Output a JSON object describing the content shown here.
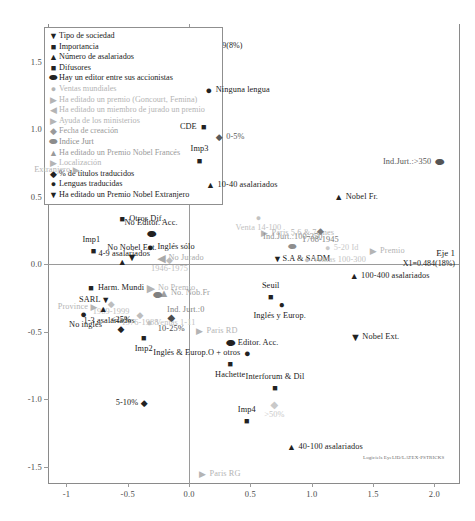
{
  "axes": {
    "x_axis_name": "Eje 1",
    "x_axis_value": "X1=0.484(18%)",
    "y_axis_name": "Eje 2",
    "y_axis_value": "X2=0.219(8%)",
    "x_ticks": [
      "-1",
      "-0.5",
      "0.0",
      "0.5",
      "1.0",
      "1.5",
      "2.0"
    ],
    "y_ticks": [
      "1.5",
      "1.0",
      "0.5",
      "0.0",
      "-0.5",
      "-1.0",
      "-1.5"
    ],
    "xlim": [
      -1.15,
      2.2
    ],
    "ylim": [
      -1.62,
      1.78
    ]
  },
  "software_credit": "Logiciels EyeLID/LATEX-PSTRICKS",
  "legend": {
    "items": [
      {
        "marker": "triangle-down-dark",
        "glyph": "▼",
        "color": "#222222",
        "label": "Tipo de sociedad"
      },
      {
        "marker": "square-dark",
        "glyph": "■",
        "color": "#222222",
        "label": "Importancia"
      },
      {
        "marker": "triangle-up-dark",
        "glyph": "▲",
        "color": "#222222",
        "label": "Número de asalariados"
      },
      {
        "marker": "square-dark",
        "glyph": "■",
        "color": "#222222",
        "label": "Difusores"
      },
      {
        "marker": "ellipse-dark",
        "glyph": "⬬",
        "color": "#222222",
        "label": "Hay un editor entre sus accionistas"
      },
      {
        "marker": "circle-gray",
        "glyph": "●",
        "color": "#b4b4b4",
        "label": "Ventas mundiales"
      },
      {
        "marker": "triangle-right-gray",
        "glyph": "▶",
        "color": "#b4b4b4",
        "label": "Ha editado un premio (Goncourt, Femina)"
      },
      {
        "marker": "triangle-left-gray",
        "glyph": "◀",
        "color": "#b4b4b4",
        "label": "Ha editado un miembro de jurado un premio"
      },
      {
        "marker": "triangle-right-gray",
        "glyph": "▶",
        "color": "#b4b4b4",
        "label": "Ayuda de los ministerios"
      },
      {
        "marker": "diamond-gray",
        "glyph": "◆",
        "color": "#9a9a9a",
        "label": "Fecha de creación"
      },
      {
        "marker": "ellipse-gray",
        "glyph": "⬬",
        "color": "#8c8c8c",
        "label": "Indice Jurt"
      },
      {
        "marker": "triangle-up-gray",
        "glyph": "▲",
        "color": "#9a9a9a",
        "label": "Ha editado un Premio Nobel Francés"
      },
      {
        "marker": "triangle-right-gray",
        "glyph": "▶",
        "color": "#b4b4b4",
        "label": "Localización"
      },
      {
        "marker": "diamond-dark",
        "glyph": "◆",
        "color": "#222222",
        "label": "% de títulos traducidos"
      },
      {
        "marker": "circle-dark",
        "glyph": "●",
        "color": "#222222",
        "label": "Lenguas traducidas"
      },
      {
        "marker": "triangle-down-dark2",
        "glyph": "▼",
        "color": "#222222",
        "label": "Ha editado un Premio Nobel Extranjero"
      }
    ]
  },
  "chart_data": {
    "type": "scatter",
    "title": "",
    "xlabel": "Eje 1  X1=0.484(18%)",
    "ylabel": "Eje 2  X2=0.219(8%)",
    "xlim": [
      -1.15,
      2.2
    ],
    "ylim": [
      -1.62,
      1.78
    ],
    "grid": false,
    "legend_position": "top-left",
    "points": [
      {
        "label": "Ninguna lengua",
        "x": 0.16,
        "y": 1.29,
        "glyph": "●",
        "color": "#222222",
        "size": 11,
        "lpos": "l",
        "ldx": 7,
        "ldy": 0
      },
      {
        "label": "CDE",
        "x": 0.12,
        "y": 1.02,
        "glyph": "■",
        "color": "#222222",
        "size": 9,
        "lpos": "r",
        "ldx": -7,
        "ldy": 0
      },
      {
        "label": "0-5%",
        "x": 0.245,
        "y": 0.945,
        "glyph": "◆",
        "color": "#5a5a5a",
        "size": 9,
        "lpos": "l",
        "ldx": 7,
        "ldy": 0
      },
      {
        "label": "Imp3",
        "x": 0.085,
        "y": 0.765,
        "glyph": "■",
        "color": "#222222",
        "size": 9,
        "lpos": "c",
        "ldx": 0,
        "ldy": -12
      },
      {
        "label": "Extranjero",
        "x": -0.92,
        "y": 0.7,
        "glyph": "▶",
        "color": "#b4b4b4",
        "size": 9,
        "lpos": "r",
        "ldx": -6,
        "ldy": 0
      },
      {
        "label": "Ind.Jurt.:>350",
        "x": 2.04,
        "y": 0.755,
        "glyph": "⬬",
        "color": "#555555",
        "size": 11,
        "lpos": "r",
        "ldx": -8,
        "ldy": 0
      },
      {
        "label": "Imp1",
        "x": -0.78,
        "y": 0.095,
        "glyph": "■",
        "color": "#222222",
        "size": 9,
        "lpos": "c",
        "ldx": -2,
        "ldy": -11
      },
      {
        "label": "10-40 asalariados",
        "x": 0.175,
        "y": 0.59,
        "glyph": "▲",
        "color": "#222222",
        "size": 9,
        "lpos": "l",
        "ldx": 7,
        "ldy": 0
      },
      {
        "label": "Nobel Fr.",
        "x": 1.22,
        "y": 0.5,
        "glyph": "▲",
        "color": "#222222",
        "size": 9,
        "lpos": "l",
        "ldx": 7,
        "ldy": 0
      },
      {
        "label": "Otros Dif.",
        "x": -0.545,
        "y": 0.335,
        "glyph": "■",
        "color": "#222222",
        "size": 9,
        "lpos": "l",
        "ldx": 7,
        "ldy": 0
      },
      {
        "label": "Venta 14-100",
        "x": 0.565,
        "y": 0.34,
        "glyph": "●",
        "color": "#c2c2c2",
        "size": 9,
        "lpos": "c",
        "ldx": 0,
        "ldy": 10
      },
      {
        "label": "Paris 5,6 & 7emes",
        "x": 0.615,
        "y": 0.235,
        "glyph": "▶",
        "color": "#b4b4b4",
        "size": 9,
        "lpos": "l",
        "ldx": 7,
        "ldy": 0
      },
      {
        "label": "1708-1945",
        "x": 1.07,
        "y": 0.245,
        "glyph": "◆",
        "color": "#7a7a7a",
        "size": 9,
        "lpos": "c",
        "ldx": 0,
        "ldy": 9
      },
      {
        "label": "No Editor. Acc.",
        "x": -0.31,
        "y": 0.225,
        "glyph": "⬬",
        "color": "#222222",
        "size": 11,
        "lpos": "c",
        "ldx": 0,
        "ldy": -11
      },
      {
        "label": "Inglés sólo",
        "x": -0.315,
        "y": 0.125,
        "glyph": "●",
        "color": "#222222",
        "size": 11,
        "lpos": "l",
        "ldx": 7,
        "ldy": 0
      },
      {
        "label": "No Nobel Ext.",
        "x": -0.465,
        "y": 0.055,
        "glyph": "▼",
        "color": "#222222",
        "size": 11,
        "lpos": "c",
        "ldx": 0,
        "ldy": -9
      },
      {
        "label": "4-9 asalariados",
        "x": -0.545,
        "y": 0.015,
        "glyph": "▲",
        "color": "#222222",
        "size": 9,
        "lpos": "c",
        "ldx": 2,
        "ldy": -8
      },
      {
        "label": "No Jurado",
        "x": -0.225,
        "y": 0.045,
        "glyph": "◀",
        "color": "#a9a9a9",
        "size": 11,
        "lpos": "l",
        "ldx": 7,
        "ldy": 0
      },
      {
        "label": "1946-1975",
        "x": -0.16,
        "y": 0.03,
        "glyph": "◆",
        "color": "#bdbdbd",
        "size": 9,
        "lpos": "c",
        "ldx": 0,
        "ldy": 9
      },
      {
        "label": "S.A & SADM",
        "x": 0.72,
        "y": 0.04,
        "glyph": "▼",
        "color": "#222222",
        "size": 9,
        "lpos": "l",
        "ldx": 5,
        "ldy": 0
      },
      {
        "label": "Ventas 100-300",
        "x": 0.96,
        "y": 0.035,
        "glyph": "●",
        "color": "#c2c2c2",
        "size": 9,
        "lpos": "l",
        "ldx": 6,
        "ldy": 0
      },
      {
        "label": "Premio",
        "x": 1.5,
        "y": 0.1,
        "glyph": "▶",
        "color": "#b4b4b4",
        "size": 9,
        "lpos": "l",
        "ldx": 7,
        "ldy": 0
      },
      {
        "label": "Ind.Jurt.:100-350",
        "x": 0.845,
        "y": 0.125,
        "glyph": "⬬",
        "color": "#8e8e8e",
        "size": 10,
        "lpos": "c",
        "ldx": 0,
        "ldy": -10
      },
      {
        "label": "5-20 Id",
        "x": 1.13,
        "y": 0.12,
        "glyph": "●",
        "color": "#c9c9c9",
        "size": 9,
        "lpos": "l",
        "ldx": 6,
        "ldy": 0
      },
      {
        "label": "100-400 asalariados",
        "x": 1.345,
        "y": -0.09,
        "glyph": "▲",
        "color": "#222222",
        "size": 9,
        "lpos": "l",
        "ldx": 7,
        "ldy": 0
      },
      {
        "label": "Harm. Mundi",
        "x": -0.8,
        "y": -0.175,
        "glyph": "■",
        "color": "#222222",
        "size": 9,
        "lpos": "l",
        "ldx": 7,
        "ldy": 0
      },
      {
        "label": "No Premio",
        "x": -0.31,
        "y": -0.175,
        "glyph": "▶",
        "color": "#b4b4b4",
        "size": 11,
        "lpos": "l",
        "ldx": 7,
        "ldy": 0
      },
      {
        "label": "No. Nob.Fr",
        "x": -0.205,
        "y": -0.215,
        "glyph": "▲",
        "color": "#9e9e9e",
        "size": 11,
        "lpos": "l",
        "ldx": 7,
        "ldy": 0
      },
      {
        "label": "Ind. Jurt.:0",
        "x": -0.255,
        "y": -0.225,
        "glyph": "⬬",
        "color": "#808080",
        "size": 11,
        "lpos": "c",
        "ldx": 28,
        "ldy": 15
      },
      {
        "label": "Seuil",
        "x": 0.665,
        "y": -0.24,
        "glyph": "■",
        "color": "#222222",
        "size": 9,
        "lpos": "c",
        "ldx": 0,
        "ldy": -11
      },
      {
        "label": "Inglés y Europ.",
        "x": 0.755,
        "y": -0.3,
        "glyph": "●",
        "color": "#222222",
        "size": 10,
        "lpos": "c",
        "ldx": -2,
        "ldy": 11
      },
      {
        "label": "SARL",
        "x": -0.68,
        "y": -0.265,
        "glyph": "▼",
        "color": "#222222",
        "size": 9,
        "lpos": "r",
        "ldx": -5,
        "ldy": 0
      },
      {
        "label": "1989-1999",
        "x": -0.635,
        "y": -0.295,
        "glyph": "◆",
        "color": "#bdbdbd",
        "size": 9,
        "lpos": "c",
        "ldx": 0,
        "ldy": 8
      },
      {
        "label": "Province",
        "x": -0.775,
        "y": -0.315,
        "glyph": "▶",
        "color": "#b4b4b4",
        "size": 9,
        "lpos": "r",
        "ldx": -6,
        "ldy": 0
      },
      {
        "label": "1-3 asalariados",
        "x": -0.7,
        "y": -0.33,
        "glyph": "▲",
        "color": "#222222",
        "size": 9,
        "lpos": "c",
        "ldx": 6,
        "ldy": 12
      },
      {
        "label": "1976-1988",
        "x": -0.4,
        "y": -0.375,
        "glyph": "◆",
        "color": "#bdbdbd",
        "size": 9,
        "lpos": "c",
        "ldx": 0,
        "ldy": 8
      },
      {
        "label": "No inglés",
        "x": -0.86,
        "y": -0.37,
        "glyph": "●",
        "color": "#222222",
        "size": 11,
        "lpos": "c",
        "ldx": 2,
        "ldy": 11
      },
      {
        "label": "10-25%",
        "x": -0.145,
        "y": -0.4,
        "glyph": "◆",
        "color": "#4d4d4d",
        "size": 10,
        "lpos": "c",
        "ldx": 0,
        "ldy": 11
      },
      {
        "label": "Ventas 1-11",
        "x": -0.325,
        "y": -0.435,
        "glyph": "●",
        "color": "#c2c2c2",
        "size": 10,
        "lpos": "l",
        "ldx": 6,
        "ldy": 0
      },
      {
        "label": "<25%",
        "x": -0.555,
        "y": -0.48,
        "glyph": "◆",
        "color": "#222222",
        "size": 9,
        "lpos": "c",
        "ldx": 0,
        "ldy": -9
      },
      {
        "label": "Imp2",
        "x": -0.37,
        "y": -0.545,
        "glyph": "■",
        "color": "#222222",
        "size": 9,
        "lpos": "c",
        "ldx": 0,
        "ldy": 11
      },
      {
        "label": "Paris RD",
        "x": 0.085,
        "y": -0.495,
        "glyph": "▶",
        "color": "#b4b4b4",
        "size": 9,
        "lpos": "l",
        "ldx": 7,
        "ldy": 0
      },
      {
        "label": "Editor. Acc.",
        "x": 0.34,
        "y": -0.58,
        "glyph": "⬬",
        "color": "#222222",
        "size": 11,
        "lpos": "l",
        "ldx": 7,
        "ldy": 0
      },
      {
        "label": "Nobel Ext.",
        "x": 1.355,
        "y": -0.535,
        "glyph": "▼",
        "color": "#222222",
        "size": 11,
        "lpos": "l",
        "ldx": 7,
        "ldy": 0
      },
      {
        "label": "Inglés & Europ.O + otros",
        "x": 0.475,
        "y": -0.655,
        "glyph": "●",
        "color": "#222222",
        "size": 11,
        "lpos": "r",
        "ldx": -7,
        "ldy": 0
      },
      {
        "label": "Hachette",
        "x": 0.335,
        "y": -0.735,
        "glyph": "■",
        "color": "#222222",
        "size": 9,
        "lpos": "c",
        "ldx": 0,
        "ldy": 11
      },
      {
        "label": "Interforum & Dil",
        "x": 0.7,
        "y": -0.915,
        "glyph": "■",
        "color": "#222222",
        "size": 9,
        "lpos": "c",
        "ldx": 0,
        "ldy": -11
      },
      {
        "label": "5-10%",
        "x": -0.365,
        "y": -1.03,
        "glyph": "◆",
        "color": "#222222",
        "size": 9,
        "lpos": "r",
        "ldx": -6,
        "ldy": 0
      },
      {
        "label": ">50%",
        "x": 0.695,
        "y": -1.045,
        "glyph": "◆",
        "color": "#c9c9c9",
        "size": 10,
        "lpos": "c",
        "ldx": 0,
        "ldy": 10
      },
      {
        "label": "Imp4",
        "x": 0.47,
        "y": -1.16,
        "glyph": "■",
        "color": "#222222",
        "size": 9,
        "lpos": "c",
        "ldx": 0,
        "ldy": -11
      },
      {
        "label": "40-100 asalariados",
        "x": 0.835,
        "y": -1.355,
        "glyph": "▲",
        "color": "#222222",
        "size": 9,
        "lpos": "l",
        "ldx": 7,
        "ldy": 0
      },
      {
        "label": "Paris RG",
        "x": 0.11,
        "y": -1.555,
        "glyph": "▶",
        "color": "#b4b4b4",
        "size": 9,
        "lpos": "l",
        "ldx": 7,
        "ldy": 0
      }
    ]
  }
}
